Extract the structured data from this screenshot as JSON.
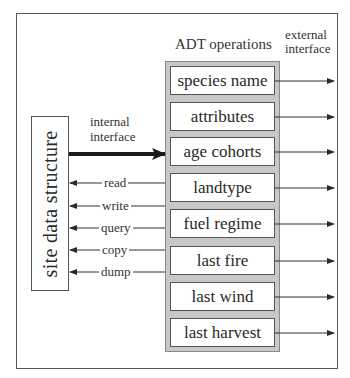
{
  "diagram": {
    "headers": {
      "adt_operations": "ADT operations",
      "external_interface_line1": "external",
      "external_interface_line2": "interface"
    },
    "site_structure": {
      "label": "site data structure"
    },
    "internal_interface": {
      "line1": "internal",
      "line2": "interface"
    },
    "messages": [
      {
        "label": "read"
      },
      {
        "label": "write"
      },
      {
        "label": "query"
      },
      {
        "label": "copy"
      },
      {
        "label": "dump"
      }
    ],
    "operations": [
      {
        "label": "species name"
      },
      {
        "label": "attributes"
      },
      {
        "label": "age cohorts"
      },
      {
        "label": "landtype"
      },
      {
        "label": "fuel regime"
      },
      {
        "label": "last fire"
      },
      {
        "label": "last wind"
      },
      {
        "label": "last harvest"
      }
    ],
    "colors": {
      "ops_container_fill": "#c8c8c8",
      "line": "#333333"
    }
  }
}
